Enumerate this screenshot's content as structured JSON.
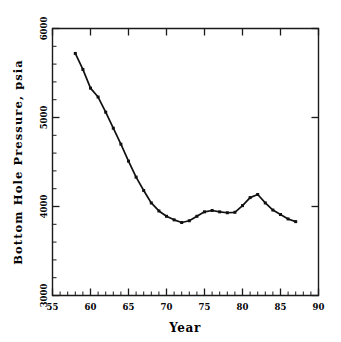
{
  "chart_data": {
    "type": "line",
    "title": "",
    "subtitle": "",
    "xlabel": "Year",
    "ylabel": "Bottom Hole Pressure, psia",
    "xlim": [
      55,
      90
    ],
    "ylim": [
      3000,
      6000
    ],
    "grid": false,
    "legend": "none",
    "x_major_ticks": [
      55,
      60,
      65,
      70,
      75,
      80,
      85,
      90
    ],
    "x_major_tick_labels": [
      "55",
      "60",
      "65",
      "70",
      "75",
      "80",
      "85",
      "90"
    ],
    "x_minor_tick_interval": 1,
    "y_major_ticks": [
      3000,
      4000,
      5000,
      6000
    ],
    "y_major_tick_labels": [
      "3000",
      "4000",
      "5000",
      "6000"
    ],
    "y_minor_tick_interval": 200,
    "marker": "filled-square",
    "x": [
      58,
      59,
      60,
      61,
      62,
      63,
      64,
      65,
      66,
      67,
      68,
      69,
      70,
      71,
      72,
      73,
      74,
      75,
      76,
      77,
      78,
      79,
      80,
      81,
      82,
      83,
      84,
      85,
      86,
      87
    ],
    "values": [
      5720,
      5540,
      5330,
      5230,
      5060,
      4880,
      4700,
      4510,
      4330,
      4180,
      4040,
      3950,
      3890,
      3850,
      3820,
      3840,
      3890,
      3940,
      3955,
      3940,
      3930,
      3935,
      4010,
      4100,
      4135,
      4040,
      3960,
      3910,
      3860,
      3830
    ],
    "series": [
      {
        "name": "Bottom Hole Pressure",
        "values": [
          5720,
          5540,
          5330,
          5230,
          5060,
          4880,
          4700,
          4510,
          4330,
          4180,
          4040,
          3950,
          3890,
          3850,
          3820,
          3840,
          3890,
          3940,
          3955,
          3940,
          3930,
          3935,
          4010,
          4100,
          4135,
          4040,
          3960,
          3910,
          3860,
          3830
        ]
      }
    ],
    "annotations": []
  },
  "colors": {
    "line": "#111111",
    "marker": "#111111",
    "axis": "#1a1a1a",
    "background": "#ffffff",
    "text": "#000000"
  }
}
